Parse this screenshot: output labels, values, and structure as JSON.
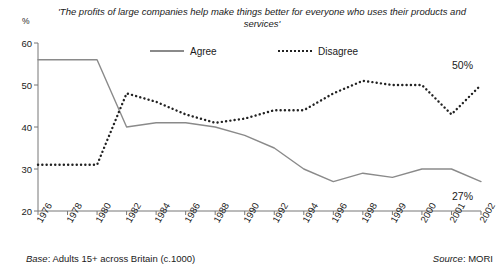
{
  "chart_data": {
    "type": "line",
    "title": "'The profits of large companies help make things better for everyone who uses their products and services'",
    "xlabel": "",
    "ylabel": "%",
    "ylim": [
      20,
      60
    ],
    "yticks": [
      20,
      30,
      40,
      50,
      60
    ],
    "grid": false,
    "legend_position": "top-center",
    "categories": [
      "1976",
      "1978",
      "1980",
      "1982",
      "1984",
      "1986",
      "1988",
      "1990",
      "1992",
      "1994",
      "1996",
      "1998",
      "1999",
      "2000",
      "2001",
      "2002"
    ],
    "series": [
      {
        "name": "Agree",
        "style": "solid",
        "color": "#8a8a8a",
        "values": [
          56,
          56,
          56,
          40,
          41,
          41,
          40,
          38,
          35,
          30,
          27,
          29,
          28,
          30,
          30,
          27
        ],
        "end_label": "27%"
      },
      {
        "name": "Disagree",
        "style": "dotted",
        "color": "#222222",
        "values": [
          31,
          31,
          31,
          48,
          46,
          43,
          41,
          42,
          44,
          44,
          48,
          51,
          50,
          50,
          43,
          50
        ],
        "end_label": "50%"
      }
    ]
  },
  "legend": {
    "agree_label": "Agree",
    "disagree_label": "Disagree"
  },
  "footer": {
    "base_prefix": "Base",
    "base_text": ": Adults 15+ across Britain (c.1000)",
    "source_prefix": "Source",
    "source_text": ": MORI"
  }
}
